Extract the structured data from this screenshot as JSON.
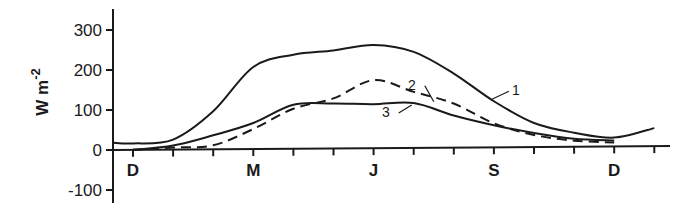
{
  "chart_data": {
    "type": "line",
    "title": "",
    "xlabel": "",
    "ylabel": "W m",
    "ylabel_superscript": "-2",
    "ylim": [
      -120,
      320
    ],
    "yticks": [
      300,
      200,
      100,
      0,
      -100
    ],
    "ytick_labels": [
      "300",
      "200",
      "100",
      "0",
      "-100"
    ],
    "x_months": [
      "D",
      "J",
      "F",
      "M",
      "A",
      "M",
      "J",
      "J",
      "A",
      "S",
      "O",
      "N",
      "D",
      "J"
    ],
    "x_tick_labels": [
      {
        "index": 0,
        "label": "D"
      },
      {
        "index": 3,
        "label": "M"
      },
      {
        "index": 6,
        "label": "J"
      },
      {
        "index": 9,
        "label": "S"
      },
      {
        "index": 12,
        "label": "D"
      }
    ],
    "grid": false,
    "series": [
      {
        "name": "1",
        "style": "solid",
        "x": [
          -0.5,
          0,
          1,
          2,
          3,
          4,
          5,
          6,
          7,
          8,
          9,
          10,
          11,
          12,
          13
        ],
        "values": [
          18,
          16,
          25,
          95,
          205,
          235,
          245,
          258,
          240,
          185,
          115,
          60,
          35,
          22,
          45
        ]
      },
      {
        "name": "2",
        "style": "dashed",
        "x": [
          0,
          1,
          2,
          3,
          4,
          5,
          6,
          7,
          8,
          9,
          10,
          11,
          12
        ],
        "values": [
          0,
          5,
          10,
          50,
          100,
          125,
          170,
          140,
          110,
          60,
          30,
          15,
          10
        ]
      },
      {
        "name": "3",
        "style": "solid",
        "x": [
          0,
          1,
          2,
          3,
          4,
          5,
          6,
          7,
          8,
          9,
          10,
          11,
          12
        ],
        "values": [
          0,
          10,
          35,
          65,
          110,
          112,
          110,
          112,
          80,
          55,
          35,
          20,
          15
        ]
      }
    ],
    "annotations": [
      {
        "text": "1",
        "series": "1",
        "at_index": 9
      },
      {
        "text": "2",
        "series": "2",
        "at_index": 8
      },
      {
        "text": "3",
        "series": "3",
        "at_index": 7
      }
    ]
  }
}
